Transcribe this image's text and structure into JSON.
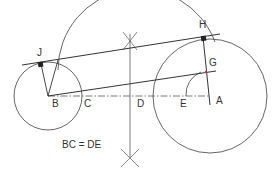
{
  "diagram": {
    "labels": {
      "A": "A",
      "B": "B",
      "C": "C",
      "D": "D",
      "E": "E",
      "G": "G",
      "H": "H",
      "J": "J"
    },
    "equation": "BC = DE",
    "colors": {
      "line": "#333333",
      "thin": "#555555",
      "accent": "#c0392b",
      "background": "#ffffff"
    }
  }
}
